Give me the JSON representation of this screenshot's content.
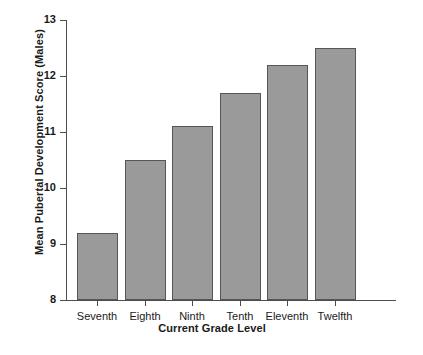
{
  "chart_data": {
    "type": "bar",
    "title": "",
    "subtitle": "",
    "xlabel": "Current Grade Level",
    "ylabel": "Mean Pubertal Development Score (Males)",
    "categories": [
      "Seventh",
      "Eighth",
      "Ninth",
      "Tenth",
      "Eleventh",
      "Twelfth"
    ],
    "values": [
      9.2,
      10.5,
      11.1,
      11.7,
      12.2,
      12.5
    ],
    "series": [
      {
        "name": "Mean Pubertal Development Score (Males)",
        "values": [
          9.2,
          10.5,
          11.1,
          11.7,
          12.2,
          12.5
        ]
      }
    ],
    "ylim": [
      8,
      13
    ],
    "yticks": [
      8,
      9,
      10,
      11,
      12,
      13
    ],
    "ytick_labels": [
      "8",
      "9",
      "10",
      "11",
      "12",
      "13"
    ],
    "grid": false,
    "legend": false,
    "legend_position": "none",
    "bar_fill_color": "#9a9a9a",
    "bar_border_color": "#54565a",
    "axis_color": "#4d4d4d",
    "background_color": "#ffffff",
    "annotations": []
  }
}
